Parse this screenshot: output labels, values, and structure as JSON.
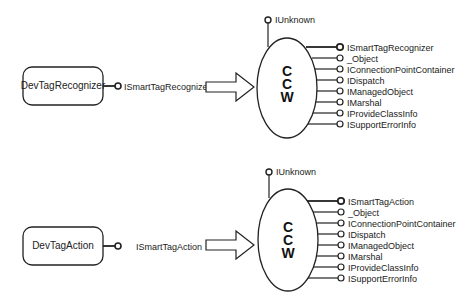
{
  "diagrams": [
    {
      "component": "DevTagRecognizer",
      "exposed_interface": "ISmartTagRecognizer",
      "wrapper_label": [
        "C",
        "C",
        "W"
      ],
      "top_interface": "IUnknown",
      "interfaces": [
        "ISmartTagRecognizer",
        "_Object",
        "IConnectionPointContainer",
        "IDispatch",
        "IManagedObject",
        "IMarshal",
        "IProvideClassInfo",
        "ISupportErrorInfo"
      ]
    },
    {
      "component": "DevTagAction",
      "exposed_interface": "ISmartTagAction",
      "wrapper_label": [
        "C",
        "C",
        "W"
      ],
      "top_interface": "IUnknown",
      "interfaces": [
        "ISmartTagAction",
        "_Object",
        "IConnectionPointContainer",
        "IDispatch",
        "IManagedObject",
        "IMarshal",
        "IProvideClassInfo",
        "ISupportErrorInfo"
      ]
    }
  ],
  "colors": {
    "stroke": "#222222",
    "background": "#ffffff"
  }
}
